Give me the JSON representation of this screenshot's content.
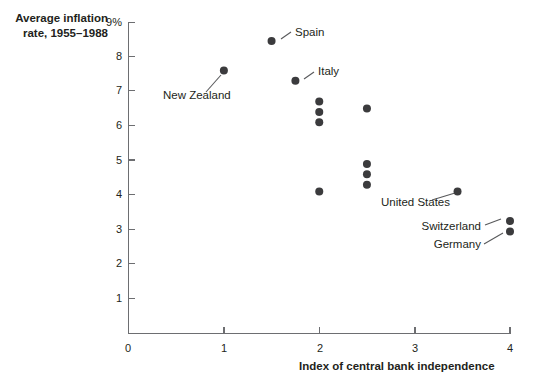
{
  "chart_data": {
    "type": "scatter",
    "title": "",
    "ylabel_line1": "Average inflation",
    "ylabel_line2": "rate, 1955–1988",
    "xlabel": "Index of central bank independence",
    "xlim": [
      0,
      4
    ],
    "ylim": [
      0,
      9
    ],
    "grid": false,
    "legend": "none",
    "xticks": [
      "0",
      "1",
      "2",
      "3",
      "4"
    ],
    "xtick_values": [
      0,
      1,
      2,
      3,
      4
    ],
    "yticks": [
      "1",
      "2",
      "3",
      "4",
      "5",
      "6",
      "7",
      "8",
      "9%"
    ],
    "ytick_values": [
      1,
      2,
      3,
      4,
      5,
      6,
      7,
      8,
      9
    ],
    "points": [
      {
        "x": 1.0,
        "y": 7.6,
        "label": "New Zealand"
      },
      {
        "x": 1.5,
        "y": 8.45,
        "label": "Spain"
      },
      {
        "x": 1.75,
        "y": 7.3,
        "label": "Italy"
      },
      {
        "x": 2.0,
        "y": 6.7,
        "label": ""
      },
      {
        "x": 2.0,
        "y": 6.4,
        "label": ""
      },
      {
        "x": 2.0,
        "y": 6.1,
        "label": ""
      },
      {
        "x": 2.0,
        "y": 4.1,
        "label": ""
      },
      {
        "x": 2.5,
        "y": 6.5,
        "label": ""
      },
      {
        "x": 2.5,
        "y": 4.9,
        "label": ""
      },
      {
        "x": 2.5,
        "y": 4.6,
        "label": ""
      },
      {
        "x": 2.5,
        "y": 4.3,
        "label": ""
      },
      {
        "x": 3.45,
        "y": 4.1,
        "label": "United States"
      },
      {
        "x": 4.0,
        "y": 3.25,
        "label": "Switzerland"
      },
      {
        "x": 4.0,
        "y": 2.95,
        "label": "Germany"
      }
    ],
    "annotations": [
      {
        "text": "Spain",
        "anchor": "start",
        "tx": 295,
        "ty": 36,
        "lx1": 281,
        "ly1": 39,
        "lx2": 291,
        "ly2": 32
      },
      {
        "text": "Italy",
        "anchor": "start",
        "tx": 318,
        "ty": 75,
        "lx1": 304,
        "ly1": 79,
        "lx2": 314,
        "ly2": 72
      },
      {
        "text": "New Zealand",
        "anchor": "start",
        "tx": 163,
        "ty": 99,
        "lx1": 221,
        "ly1": 75,
        "lx2": 206,
        "ly2": 92
      },
      {
        "text": "United States",
        "anchor": "end",
        "tx": 450,
        "ty": 206,
        "lx1": 455,
        "ly1": 193,
        "lx2": 432,
        "ly2": 200
      },
      {
        "text": "Switzerland",
        "anchor": "end",
        "tx": 481,
        "ty": 230,
        "lx1": 501,
        "ly1": 219,
        "lx2": 485,
        "ly2": 225
      },
      {
        "text": "Germany",
        "anchor": "end",
        "tx": 481,
        "ty": 248,
        "lx1": 503,
        "ly1": 233,
        "lx2": 484,
        "ly2": 244
      }
    ],
    "colors": {
      "dot": "#3b3b3d",
      "axis": "#6d6e71",
      "text": "#231f20",
      "background": "#ffffff"
    }
  }
}
